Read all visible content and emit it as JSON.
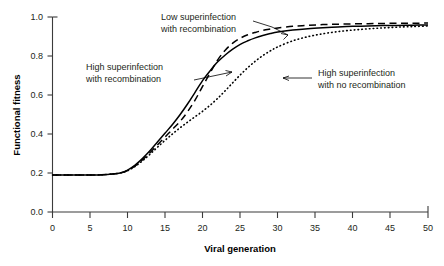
{
  "chart_data": {
    "type": "line",
    "title": "",
    "xlabel": "Viral generation",
    "ylabel": "Functional fitness",
    "xlim": [
      0,
      50
    ],
    "ylim": [
      0.0,
      1.0
    ],
    "xticks": [
      0,
      5,
      10,
      15,
      20,
      25,
      30,
      35,
      40,
      45,
      50
    ],
    "xtick_labels": [
      "0",
      "5",
      "10",
      "15",
      "20",
      "25",
      "30",
      "35",
      "40",
      "45",
      "50"
    ],
    "yticks": [
      0.0,
      0.2,
      0.4,
      0.6,
      0.8,
      1.0
    ],
    "ytick_labels": [
      "0.0",
      "0.2",
      "0.4",
      "0.6",
      "0.8",
      "1.0"
    ],
    "grid": false,
    "legend": "inline-annotations",
    "x": [
      0,
      2,
      4,
      6,
      8,
      9,
      10,
      11,
      12,
      13,
      14,
      15,
      16,
      17,
      18,
      19,
      20,
      21,
      22,
      23,
      24,
      25,
      26,
      27,
      28,
      29,
      30,
      32,
      34,
      36,
      38,
      40,
      42,
      44,
      46,
      48,
      50
    ],
    "series": [
      {
        "name": "High superinfection with recombination",
        "style": "solid",
        "values": [
          0.19,
          0.19,
          0.19,
          0.19,
          0.195,
          0.2,
          0.215,
          0.24,
          0.275,
          0.315,
          0.36,
          0.405,
          0.45,
          0.5,
          0.555,
          0.615,
          0.675,
          0.725,
          0.77,
          0.805,
          0.835,
          0.86,
          0.878,
          0.893,
          0.905,
          0.915,
          0.923,
          0.933,
          0.94,
          0.945,
          0.949,
          0.952,
          0.954,
          0.956,
          0.957,
          0.958,
          0.959
        ]
      },
      {
        "name": "Low superinfection with recombination",
        "style": "dashed",
        "values": [
          0.19,
          0.19,
          0.19,
          0.19,
          0.195,
          0.2,
          0.213,
          0.236,
          0.268,
          0.305,
          0.345,
          0.385,
          0.425,
          0.465,
          0.515,
          0.575,
          0.645,
          0.715,
          0.78,
          0.83,
          0.866,
          0.891,
          0.909,
          0.921,
          0.931,
          0.938,
          0.944,
          0.952,
          0.957,
          0.961,
          0.963,
          0.965,
          0.966,
          0.967,
          0.968,
          0.968,
          0.969
        ]
      },
      {
        "name": "High superinfection with no recombination",
        "style": "dotted",
        "values": [
          0.19,
          0.19,
          0.19,
          0.19,
          0.195,
          0.2,
          0.212,
          0.234,
          0.263,
          0.297,
          0.333,
          0.368,
          0.401,
          0.432,
          0.461,
          0.489,
          0.517,
          0.548,
          0.583,
          0.622,
          0.663,
          0.703,
          0.74,
          0.773,
          0.802,
          0.826,
          0.847,
          0.878,
          0.899,
          0.914,
          0.925,
          0.933,
          0.939,
          0.944,
          0.948,
          0.951,
          0.954
        ]
      }
    ],
    "annotations": [
      {
        "id": "low-superinfection",
        "line1": "Low superinfection",
        "line2": "with recombination"
      },
      {
        "id": "high-superinfection-recomb",
        "line1": "High superinfection",
        "line2": "with recombination"
      },
      {
        "id": "high-superinfection-norecomb",
        "line1": "High superinfection",
        "line2": "with no recombination"
      }
    ]
  }
}
